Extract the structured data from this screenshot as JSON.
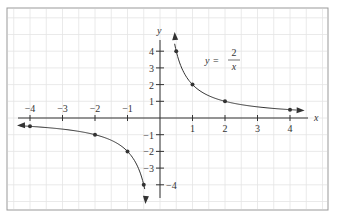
{
  "chart_data": {
    "type": "line",
    "title": "",
    "equation": {
      "lhs": "y",
      "equals": "=",
      "numerator": "2",
      "denominator": "x"
    },
    "xlabel": "x",
    "ylabel": "y",
    "xlim": [
      -4.4,
      4.6
    ],
    "ylim": [
      -4.8,
      5.1
    ],
    "x_ticks": [
      -4,
      -3,
      -2,
      -1,
      1,
      2,
      3,
      4
    ],
    "x_tick_labels": [
      "−4",
      "−3",
      "−2",
      "−1",
      "1",
      "2",
      "3",
      "4"
    ],
    "y_ticks": [
      4,
      3,
      2,
      1,
      -1,
      -2,
      -3,
      -4
    ],
    "y_tick_labels": [
      "4",
      "3",
      "2",
      "1",
      "−1",
      "−2",
      "−3",
      "−4"
    ],
    "grid": true,
    "series": [
      {
        "name": "y = 2/x (x > 0)",
        "x": [
          0.5,
          1,
          2,
          4
        ],
        "y": [
          4,
          2,
          1,
          0.5
        ]
      },
      {
        "name": "y = 2/x (x < 0)",
        "x": [
          -4,
          -2,
          -1,
          -0.5
        ],
        "y": [
          -0.5,
          -1,
          -2,
          -4
        ]
      }
    ],
    "points": [
      {
        "x": 0.5,
        "y": 4
      },
      {
        "x": 1,
        "y": 2
      },
      {
        "x": 2,
        "y": 1
      },
      {
        "x": 4,
        "y": 0.5
      },
      {
        "x": -4,
        "y": -0.5
      },
      {
        "x": -2,
        "y": -1
      },
      {
        "x": -1,
        "y": -2
      },
      {
        "x": -0.5,
        "y": -4
      }
    ],
    "colors": {
      "curve": "#333333",
      "axis": "#333333",
      "grid": "#e4e4e4",
      "frame": "#999999"
    }
  }
}
